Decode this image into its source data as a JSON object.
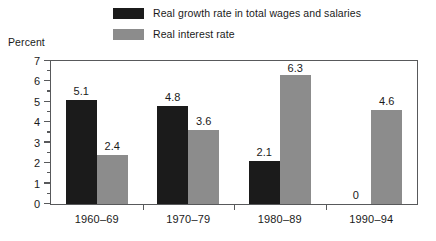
{
  "chart_data": {
    "type": "bar",
    "title": "",
    "subtitle": "",
    "xlabel": "",
    "ylabel": "Percent",
    "ylim": [
      0,
      7
    ],
    "ytick_labels": [
      "0",
      "1",
      "2",
      "3",
      "4",
      "5",
      "6",
      "7"
    ],
    "ytick_values": [
      0,
      1,
      2,
      3,
      4,
      5,
      6,
      7
    ],
    "minor_tick_step": 0.5,
    "grid": false,
    "legend_position": "top-center",
    "categories": [
      "1960–69",
      "1970–79",
      "1980–89",
      "1990–94"
    ],
    "series": [
      {
        "name": "Real growth rate in total wages and salaries",
        "color": "#1b1b1b",
        "values": [
          5.1,
          4.8,
          2.1,
          0
        ],
        "value_labels": [
          "5.1",
          "4.8",
          "2.1",
          "0"
        ]
      },
      {
        "name": "Real interest rate",
        "color": "#8c8c8c",
        "values": [
          2.4,
          3.6,
          6.3,
          4.6
        ],
        "value_labels": [
          "2.4",
          "3.6",
          "6.3",
          "4.6"
        ]
      }
    ]
  },
  "legend": {
    "items": [
      {
        "label": "Real growth rate in total wages and salaries",
        "swatch": "dark"
      },
      {
        "label": "Real interest rate",
        "swatch": "gray"
      }
    ]
  },
  "colors": {
    "series_dark": "#1b1b1b",
    "series_gray": "#8c8c8c",
    "axis": "#58595b",
    "text": "#1a1a1a",
    "background": "#ffffff"
  }
}
